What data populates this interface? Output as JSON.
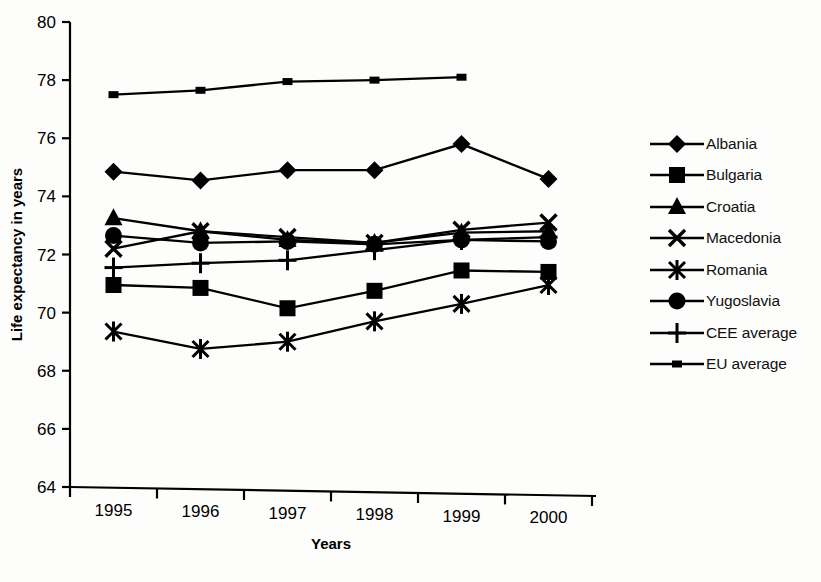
{
  "chart_data": {
    "type": "line",
    "title": "",
    "xlabel": "Years",
    "ylabel": "Life expectancy in years",
    "categories": [
      "1995",
      "1996",
      "1997",
      "1998",
      "1999",
      "2000"
    ],
    "x": [
      1995,
      1996,
      1997,
      1998,
      1999,
      2000
    ],
    "ylim": [
      64,
      80
    ],
    "yticks": [
      64,
      66,
      68,
      70,
      72,
      74,
      76,
      78,
      80
    ],
    "grid": false,
    "legend_position": "right",
    "series": [
      {
        "name": "Albania",
        "marker": "diamond",
        "values": [
          74.85,
          74.55,
          74.9,
          74.9,
          75.8,
          74.6
        ]
      },
      {
        "name": "Bulgaria",
        "marker": "square",
        "values": [
          70.95,
          70.85,
          70.15,
          70.75,
          71.45,
          71.4
        ]
      },
      {
        "name": "Croatia",
        "marker": "triangle",
        "values": [
          73.25,
          72.8,
          72.5,
          72.4,
          72.75,
          72.8
        ]
      },
      {
        "name": "Macedonia",
        "marker": "x",
        "values": [
          72.2,
          72.8,
          72.6,
          72.4,
          72.85,
          73.1
        ]
      },
      {
        "name": "Romania",
        "marker": "asterisk",
        "values": [
          69.35,
          68.75,
          69.0,
          69.7,
          70.3,
          70.95
        ]
      },
      {
        "name": "Yugoslavia",
        "marker": "circle",
        "values": [
          72.65,
          72.4,
          72.45,
          72.35,
          72.5,
          72.45
        ]
      },
      {
        "name": "CEE average",
        "marker": "plus",
        "values": [
          71.55,
          71.7,
          71.8,
          72.15,
          72.5,
          72.6
        ]
      },
      {
        "name": "EU average",
        "marker": "dash",
        "values": [
          77.5,
          77.65,
          77.95,
          78.0,
          78.1,
          null
        ]
      }
    ]
  },
  "legend": {
    "items": [
      {
        "label": "Albania"
      },
      {
        "label": "Bulgaria"
      },
      {
        "label": "Croatia"
      },
      {
        "label": "Macedonia"
      },
      {
        "label": "Romania"
      },
      {
        "label": "Yugoslavia"
      },
      {
        "label": "CEE average"
      },
      {
        "label": "EU average"
      }
    ]
  },
  "axes": {
    "y_title": "Life expectancy in years",
    "x_title": "Years",
    "y_ticks": [
      "80",
      "78",
      "76",
      "74",
      "72",
      "70",
      "68",
      "66",
      "64"
    ],
    "x_ticks": [
      "1995",
      "1996",
      "1997",
      "1998",
      "1999",
      "2000"
    ]
  },
  "colors": {
    "ink": "#000000",
    "background": "#fdfdfc"
  }
}
